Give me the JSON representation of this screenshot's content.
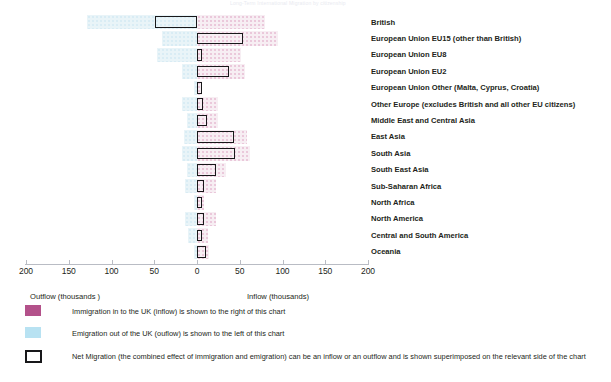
{
  "title_faint": "Long-Term International Migration by citizenship",
  "axis": {
    "tick_labels": [
      "200",
      "150",
      "100",
      "50",
      "0",
      "50",
      "100",
      "150",
      "200"
    ],
    "tick_values": [
      -200,
      -150,
      -100,
      -50,
      0,
      50,
      100,
      150,
      200
    ],
    "left_header": "Outflow  (thousands )",
    "right_header": "Inflow (thousands)"
  },
  "legend": {
    "items": [
      {
        "swatch": "pink-swatch",
        "text": "Immigration in to the UK (inflow) is shown to the right of this chart"
      },
      {
        "swatch": "blue-swatch",
        "text": "Emigration out of the UK (ouflow) is shown to the left of this chart"
      },
      {
        "swatch": "outline-swatch",
        "text": "Net Migration (the combined effect of immigration and emigration) can be an inflow or an outflow and is shown superimposed on the relevant side of the chart"
      }
    ]
  },
  "colors": {
    "inflow": "#b3518a",
    "outflow": "#b8e2f2",
    "net_outline": "#18181a",
    "axis": "#b9bcc4",
    "text": "#231f20"
  },
  "chart_data": {
    "type": "bar",
    "orientation": "horizontal",
    "title": "Long-Term International Migration by citizenship",
    "xlabel": "thousands",
    "ylabel": "",
    "xlim": [
      -200,
      200
    ],
    "grid": false,
    "legend_position": "bottom-left",
    "categories": [
      "British",
      "European Union EU15 (other than British)",
      "European Union EU8",
      "European Union EU2",
      "European Union Other (Malta, Cyprus, Croatia)",
      "Other Europe (excludes British and all other EU citizens)",
      "Middle East and Central Asia",
      "East Asia",
      "South Asia",
      "South East Asia",
      "Sub-Saharan Africa",
      "North Africa",
      "North America",
      "Central and South America",
      "Oceania"
    ],
    "series": [
      {
        "name": "Immigration in to the UK (inflow)",
        "direction": "right",
        "color": "#b3518a",
        "values": [
          80,
          95,
          52,
          56,
          6,
          25,
          24,
          58,
          62,
          34,
          22,
          8,
          22,
          13,
          14
        ]
      },
      {
        "name": "Emigration out of the UK (outflow)",
        "direction": "left",
        "color": "#b8e2f2",
        "values": [
          129,
          41,
          47,
          18,
          4,
          18,
          12,
          15,
          17,
          12,
          14,
          4,
          14,
          10,
          4
        ]
      },
      {
        "name": "Net Migration",
        "direction": "signed",
        "color": "#18181a",
        "values": [
          -49,
          54,
          5,
          38,
          2,
          7,
          12,
          43,
          45,
          22,
          8,
          4,
          8,
          3,
          10
        ]
      }
    ]
  }
}
